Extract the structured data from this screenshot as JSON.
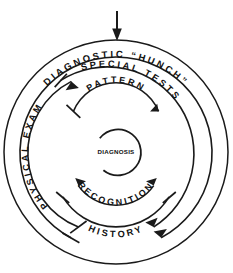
{
  "diagram": {
    "type": "concentric-arc-spiral",
    "center": {
      "x": 116,
      "y": 152
    },
    "stroke_color": "#1a1a1a",
    "background_color": "#ffffff",
    "entry_arrow": {
      "name": "input-arrow",
      "direction": "down",
      "x": 117,
      "y_start": 10,
      "y_end": 40
    },
    "rings": [
      {
        "id": "ring-outer-boundary",
        "label": "",
        "radius": 112,
        "closed": true,
        "has_label": false
      },
      {
        "id": "ring-diagnostic-hunch",
        "label": "DIAGNOSTIC “HUNCH”",
        "radius": 96,
        "font_size": 9.5,
        "start_deg": -118,
        "end_deg": 62,
        "letter_spacing": 2.6
      },
      {
        "id": "ring-special-tests",
        "label": "SPECIAL TESTS",
        "radius": 80,
        "font_size": 9.2,
        "start_deg": -72,
        "end_deg": 62,
        "letter_spacing": 2.6
      },
      {
        "id": "ring-physical-exam",
        "label": "PHYSICAL EXAM",
        "radius": 80,
        "font_size": 9.2,
        "start_deg": 118,
        "end_deg": 252,
        "letter_spacing": 2.6
      },
      {
        "id": "ring-history",
        "label": "HISTORY",
        "radius": 62,
        "font_size": 9.2,
        "start_deg": 60,
        "end_deg": 120,
        "letter_spacing": 2.6
      },
      {
        "id": "ring-pattern",
        "label": "PATTERN",
        "radius": 46,
        "font_size": 9.0,
        "start_deg": -118,
        "end_deg": -62,
        "letter_spacing": 2.4
      },
      {
        "id": "ring-recognition",
        "label": "RECOGNITION",
        "radius": 46,
        "font_size": 9.0,
        "start_deg": 35,
        "end_deg": 145,
        "letter_spacing": 2.4
      },
      {
        "id": "ring-diagnosis-core",
        "label": "DIAGNOSIS",
        "radius": 23,
        "font_size": 6.2,
        "is_core": true
      }
    ],
    "core": {
      "name": "diagnosis-core",
      "label": "DIAGNOSIS",
      "radius": 23
    },
    "labels": {
      "diagnostic_hunch": "DIAGNOSTIC “HUNCH”",
      "special_tests": "SPECIAL TESTS",
      "physical_exam": "PHYSICAL EXAM",
      "history": "HISTORY",
      "pattern": "PATTERN",
      "recognition": "RECOGNITION",
      "diagnosis": "DIAGNOSIS"
    }
  }
}
